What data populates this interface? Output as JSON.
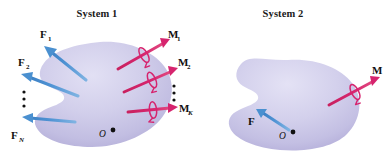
{
  "figure": {
    "caption_present": false,
    "background_color": "#ffffff",
    "colors": {
      "body_fill_light": "#d8d5ef",
      "body_fill_mid": "#c9c5e6",
      "body_fill_dark": "#b3add9",
      "force_arrow": "#4a90d0",
      "force_arrow_dark": "#3a7ebd",
      "moment_arrow": "#d6246e",
      "moment_arrow_dark": "#b81a5c",
      "text": "#111111"
    }
  },
  "systems": [
    {
      "id": "system-1",
      "title": "System 1",
      "body_point": {
        "label": "O",
        "x": 105,
        "y": 133
      },
      "forces": [
        {
          "label": "F",
          "subscript": "1",
          "sub_italic": false
        },
        {
          "label": "F",
          "subscript": "2",
          "sub_italic": false
        },
        {
          "label": "F",
          "subscript": "N",
          "sub_italic": true
        }
      ],
      "force_ellipsis": "⋮",
      "moments": [
        {
          "label": "M",
          "subscript": "1",
          "sub_italic": false
        },
        {
          "label": "M",
          "subscript": "2",
          "sub_italic": false
        },
        {
          "label": "M",
          "subscript": "K",
          "sub_italic": true
        }
      ],
      "moment_ellipsis": "⋮"
    },
    {
      "id": "system-2",
      "title": "System 2",
      "body_point": {
        "label": "O",
        "x": 285,
        "y": 134
      },
      "forces": [
        {
          "label": "F",
          "subscript": "",
          "sub_italic": false
        }
      ],
      "moments": [
        {
          "label": "M",
          "subscript": "",
          "sub_italic": false
        }
      ]
    }
  ],
  "labels": {
    "s1_title": "System 1",
    "s2_title": "System 2",
    "f1": "F",
    "f1_sub": "1",
    "f2": "F",
    "f2_sub": "2",
    "fn": "F",
    "fn_sub": "N",
    "m1": "M",
    "m1_sub": "1",
    "m2": "M",
    "m2_sub": "2",
    "mk": "M",
    "mk_sub": "K",
    "s2_f": "F",
    "s2_m": "M",
    "s1_point": "O",
    "s2_point": "O",
    "vdots": "⋮"
  }
}
